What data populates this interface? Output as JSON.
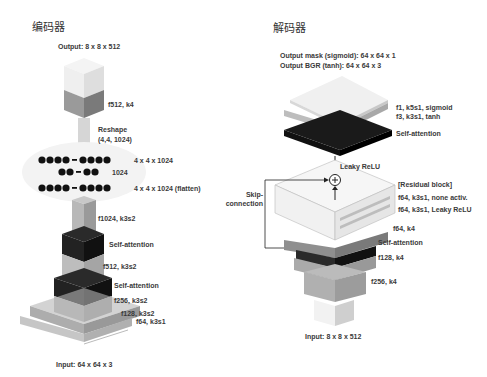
{
  "encoder": {
    "title": "编码器",
    "output_label": "Output: 8 x 8 x 512",
    "input_label": "Input: 64 x 64 x 3",
    "layers": {
      "f512_k4": "f512, k4",
      "reshape_line1": "Reshape",
      "reshape_line2": "(4,4, 1024)",
      "dense_row1": "4 x 4 x 1024",
      "dense_row2": "1024",
      "dense_row3": "4 x 4 x 1024 (flatten)",
      "f1024": "f1024, k3s2",
      "self_attention_1": "Self-attention",
      "f512_k3s2": "f512, k3s2",
      "self_attention_2": "Self-attention",
      "f256": "f256, k3s2",
      "f128": "f128, k3s2",
      "f64": "f64, k3s1"
    }
  },
  "decoder": {
    "title": "解码器",
    "output_mask_label": "Output mask (sigmoid): 64 x 64 x 1",
    "output_bgr_label": "Output BGR (tanh): 64 x 64 x 3",
    "input_label": "Input: 8 x 8 x 512",
    "layers": {
      "f1": "f1, k5s1, sigmoid",
      "f3": "f3, k3s1, tanh",
      "self_attention_top": "Self-attention",
      "leaky_relu": "Leaky ReLU",
      "residual_block": "[Residual block]",
      "res_conv1": "f64, k3s1, none activ.",
      "res_conv2": "f64, k3s1, Leaky ReLU",
      "f64_k4": "f64, k4",
      "self_attention_mid": "Self-attention",
      "f128_k4": "f128, k4",
      "f256_k4": "f256, k4"
    },
    "skip_line1": "Skip-",
    "skip_line2": "connection",
    "add_symbol": "+"
  },
  "colors": {
    "light": "#e8e8e8",
    "mid": "#a8a8a8",
    "dark": "#1e1e1e",
    "line": "#333333"
  }
}
